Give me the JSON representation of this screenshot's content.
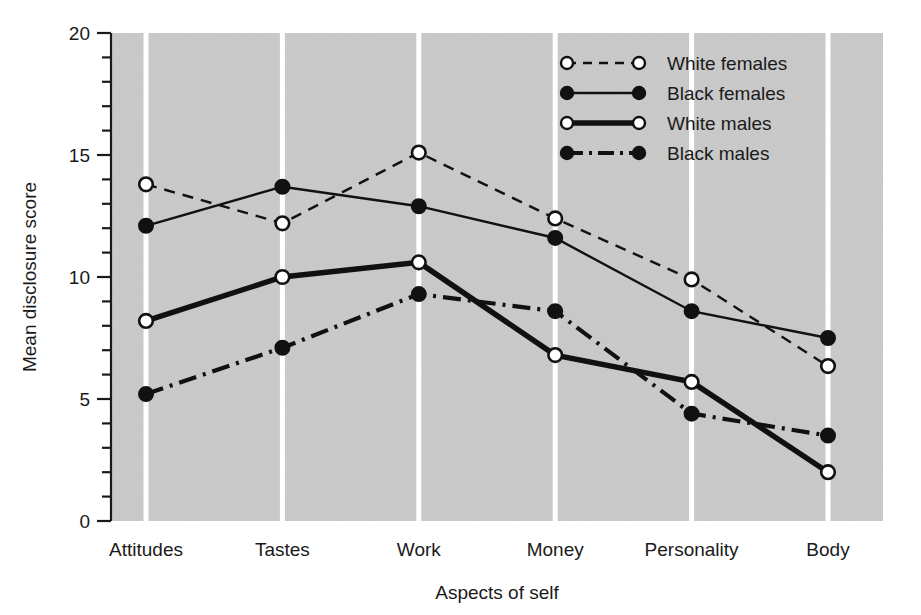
{
  "chart_data": {
    "type": "line",
    "title": "",
    "xlabel": "Aspects of self",
    "ylabel": "Mean disclosure score",
    "categories": [
      "Attitudes",
      "Tastes",
      "Work",
      "Money",
      "Personality",
      "Body"
    ],
    "ylim": [
      0,
      20
    ],
    "yticks": [
      0,
      5,
      10,
      15,
      20
    ],
    "ytick_labels": [
      "0",
      "5",
      "10",
      "15",
      "20"
    ],
    "minor_tick_step": 1,
    "grid": "vertical-white-gridlines-at-categories",
    "legend_position": "top-right-inside",
    "plot_background": "#c9c9c9",
    "series": [
      {
        "name": "White females",
        "marker": "open-circle",
        "line_style": "dashed",
        "color": "#111111",
        "values": [
          13.8,
          12.2,
          15.1,
          12.4,
          9.9,
          6.35
        ]
      },
      {
        "name": "Black females",
        "marker": "filled-circle",
        "line_style": "solid",
        "color": "#111111",
        "values": [
          12.1,
          13.7,
          12.9,
          11.6,
          8.6,
          7.5
        ]
      },
      {
        "name": "White males",
        "marker": "open-circle",
        "line_style": "double-solid",
        "color": "#111111",
        "values": [
          8.2,
          10.0,
          10.6,
          6.8,
          5.7,
          2.0
        ]
      },
      {
        "name": "Black males",
        "marker": "filled-circle",
        "line_style": "dash-dot",
        "color": "#111111",
        "values": [
          5.2,
          7.1,
          9.3,
          8.6,
          4.4,
          3.5
        ]
      }
    ]
  },
  "legend": {
    "entries": [
      {
        "label": "White females"
      },
      {
        "label": "Black females"
      },
      {
        "label": "White males"
      },
      {
        "label": "Black males"
      }
    ]
  }
}
